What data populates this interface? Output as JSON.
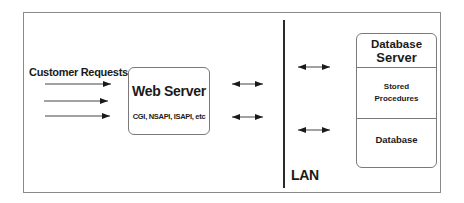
{
  "diagram": {
    "customer_requests_label": "Customer Requests",
    "web_server": {
      "title": "Web Server",
      "subtitle": "CGI, NSAPI, ISAPI, etc"
    },
    "lan_label": "LAN",
    "database_server": {
      "title_line1": "Database",
      "title_line2": "Server",
      "stored_line1": "Stored",
      "stored_line2": "Procedures",
      "database": "Database"
    },
    "colors": {
      "line": "#1a1a1a",
      "border": "#7a7a7a",
      "frame": "#8a8a8a"
    }
  }
}
